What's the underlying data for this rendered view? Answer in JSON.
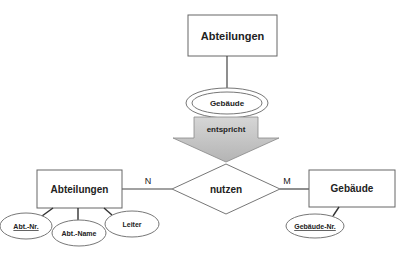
{
  "top": {
    "entity": "Abteilungen",
    "multivalued_attribute": "Gebäude"
  },
  "arrow": {
    "label": "entspricht"
  },
  "bottom": {
    "left_entity": "Abteilungen",
    "relationship": "nutzen",
    "right_entity": "Gebäude",
    "cardinality_left": "N",
    "cardinality_right": "M",
    "left_attributes": [
      {
        "label": "Abt.-Nr.",
        "key": true
      },
      {
        "label": "Abt.-Name",
        "key": false
      },
      {
        "label": "Leiter",
        "key": false
      }
    ],
    "right_attributes": [
      {
        "label": "Gebäude-Nr.",
        "key": true
      }
    ]
  },
  "colors": {
    "line": "#555555",
    "arrow_fill": "#c8c8c8",
    "background": "#ffffff"
  }
}
